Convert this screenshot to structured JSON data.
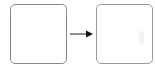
{
  "diagram": {
    "type": "flow",
    "nodes": [
      {
        "id": "source",
        "label": ""
      },
      {
        "id": "target",
        "label": ""
      }
    ],
    "edges": [
      {
        "from": "source",
        "to": "target",
        "style": "solid-arrow"
      }
    ],
    "colors": {
      "border": "#8a8a8a",
      "arrow": "#222222",
      "background": "#ffffff"
    }
  }
}
